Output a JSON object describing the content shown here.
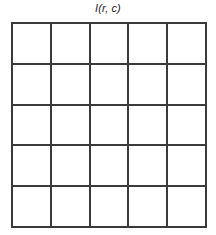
{
  "figure": {
    "title": "I(r, c)",
    "caption_style": "italic",
    "line_color": "#3a3a3a",
    "background_color": "#ffffff",
    "text_color": "#1b1b1b"
  },
  "chart_data": {
    "type": "table",
    "title": "I(r, c)",
    "xlabel": "c",
    "ylabel": "r",
    "rows": 5,
    "columns": 5,
    "grid": true,
    "legend": "none",
    "cells": [
      [
        "",
        "",
        "",
        "",
        ""
      ],
      [
        "",
        "",
        "",
        "",
        ""
      ],
      [
        "",
        "",
        "",
        "",
        ""
      ],
      [
        "",
        "",
        "",
        "",
        ""
      ],
      [
        "",
        "",
        "",
        "",
        ""
      ]
    ]
  }
}
